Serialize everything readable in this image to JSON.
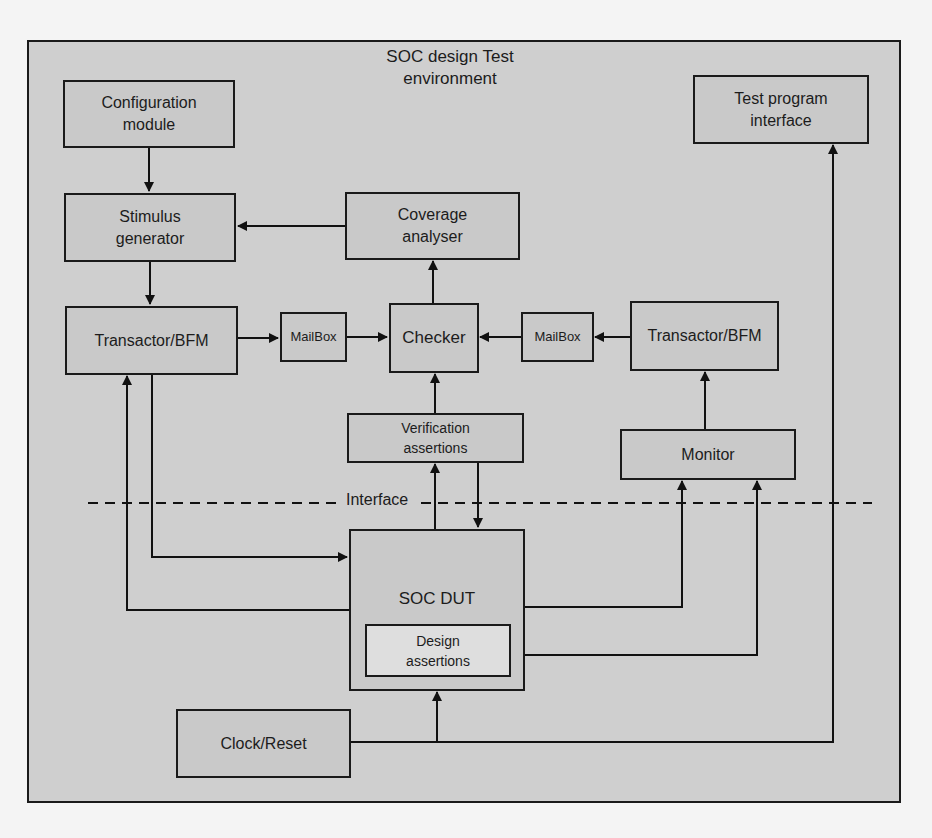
{
  "diagram": {
    "title_line1": "SOC design Test",
    "title_line2": "environment",
    "interface_label": "Interface",
    "blocks": {
      "configuration_module": {
        "line1": "Configuration",
        "line2": "module"
      },
      "stimulus_generator": {
        "line1": "Stimulus",
        "line2": "generator"
      },
      "coverage_analyser": {
        "line1": "Coverage",
        "line2": "analyser"
      },
      "test_program_interface": {
        "line1": "Test program",
        "line2": "interface"
      },
      "transactor_left": {
        "line1": "Transactor/BFM"
      },
      "mailbox_left": {
        "line1": "MailBox"
      },
      "checker": {
        "line1": "Checker"
      },
      "mailbox_right": {
        "line1": "MailBox"
      },
      "transactor_right": {
        "line1": "Transactor/BFM"
      },
      "verification_assertions": {
        "line1": "Verification",
        "line2": "assertions"
      },
      "monitor": {
        "line1": "Monitor"
      },
      "soc_dut": {
        "line1": "SOC DUT"
      },
      "design_assertions": {
        "line1": "Design",
        "line2": "assertions"
      },
      "clock_reset": {
        "line1": "Clock/Reset"
      }
    },
    "edges": [
      {
        "from": "Configuration module",
        "to": "Stimulus generator"
      },
      {
        "from": "Coverage analyser",
        "to": "Stimulus generator"
      },
      {
        "from": "Stimulus generator",
        "to": "Transactor/BFM (left)"
      },
      {
        "from": "Transactor/BFM (left)",
        "to": "MailBox (left)"
      },
      {
        "from": "MailBox (left)",
        "to": "Checker"
      },
      {
        "from": "Checker",
        "to": "Coverage analyser"
      },
      {
        "from": "Transactor/BFM (right)",
        "to": "MailBox (right)"
      },
      {
        "from": "MailBox (right)",
        "to": "Checker"
      },
      {
        "from": "Verification assertions",
        "to": "Checker"
      },
      {
        "from": "Monitor",
        "to": "Transactor/BFM (right)"
      },
      {
        "from": "Transactor/BFM (left)",
        "to": "SOC DUT"
      },
      {
        "from": "SOC DUT",
        "to": "Transactor/BFM (left)"
      },
      {
        "from": "SOC DUT",
        "to": "Verification assertions"
      },
      {
        "from": "Verification assertions",
        "to": "SOC DUT"
      },
      {
        "from": "SOC DUT",
        "to": "Monitor"
      },
      {
        "from": "Design assertions",
        "to": "Monitor"
      },
      {
        "from": "Clock/Reset",
        "to": "SOC DUT"
      },
      {
        "from": "Clock/Reset",
        "to": "Test program interface"
      }
    ]
  }
}
